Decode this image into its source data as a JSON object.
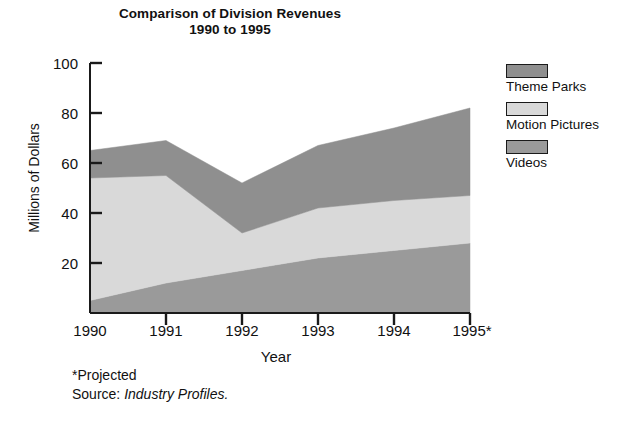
{
  "title": {
    "line1": "Comparison of Division Revenues",
    "line2": "1990 to 1995"
  },
  "axes": {
    "y_title": "Millions of Dollars",
    "x_title": "Year",
    "y_ticks": [
      "20",
      "40",
      "60",
      "80",
      "100"
    ],
    "x_ticks": [
      "1990",
      "1991",
      "1992",
      "1993",
      "1994",
      "1995*"
    ]
  },
  "legend": {
    "items": [
      {
        "label": "Theme Parks",
        "color": "#8f8f8f"
      },
      {
        "label": "Motion Pictures",
        "color": "#d9d9d9"
      },
      {
        "label": "Videos",
        "color": "#9a9a9a"
      }
    ]
  },
  "footnote": {
    "projected": "*Projected",
    "source_prefix": "Source: ",
    "source_name": "Industry Profiles."
  },
  "chart_data": {
    "type": "area",
    "title": "Comparison of Division Revenues 1990 to 1995",
    "xlabel": "Year",
    "ylabel": "Millions of Dollars",
    "categories": [
      "1990",
      "1991",
      "1992",
      "1993",
      "1994",
      "1995*"
    ],
    "ylim": [
      0,
      100
    ],
    "ytick_step": 20,
    "grid": false,
    "stacked": true,
    "legend_position": "right",
    "annotations": [
      "*Projected",
      "Source: Industry Profiles."
    ],
    "series": [
      {
        "name": "Videos",
        "color": "#9a9a9a",
        "values": [
          5,
          12,
          17,
          22,
          25,
          28
        ]
      },
      {
        "name": "Motion Pictures",
        "color": "#d9d9d9",
        "values": [
          49,
          43,
          15,
          20,
          20,
          19
        ]
      },
      {
        "name": "Theme Parks",
        "color": "#8f8f8f",
        "values": [
          11,
          14,
          20,
          25,
          29,
          35
        ]
      }
    ],
    "cumulative_tops": {
      "Videos": [
        5,
        12,
        17,
        22,
        25,
        28
      ],
      "Motion Pictures": [
        54,
        55,
        32,
        42,
        45,
        47
      ],
      "Theme Parks": [
        65,
        69,
        52,
        67,
        74,
        82
      ]
    }
  }
}
